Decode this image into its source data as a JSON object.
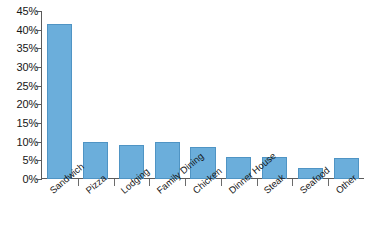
{
  "chart_data": {
    "type": "bar",
    "title": "",
    "subtitle": "",
    "xlabel": "",
    "ylabel": "",
    "categories": [
      "Sandwich",
      "Pizza",
      "Lodging",
      "Family Dining",
      "Chicken",
      "Dinner House",
      "Steak",
      "Seafood",
      "Other"
    ],
    "values": [
      41.5,
      10,
      9,
      10,
      8.5,
      6,
      6,
      3,
      5.5
    ],
    "ylim": [
      0,
      45
    ],
    "ytick_step": 5,
    "ytick_labels": [
      "0%",
      "5%",
      "10%",
      "15%",
      "20%",
      "25%",
      "30%",
      "35%",
      "40%",
      "45%"
    ],
    "ytick_values": [
      0,
      5,
      10,
      15,
      20,
      25,
      30,
      35,
      40,
      45
    ],
    "value_suffix": "%",
    "grid": false,
    "legend": false,
    "legend_position": "none",
    "series": [
      {
        "name": "Share",
        "values": [
          41.5,
          10,
          9,
          10,
          8.5,
          6,
          6,
          3,
          5.5
        ]
      }
    ]
  },
  "colors": {
    "bar_fill": "#6BAEDB",
    "bar_stroke": "#4F94C4",
    "axis": "#5A5A5A",
    "text": "#161616",
    "background": "#FFFFFF"
  }
}
